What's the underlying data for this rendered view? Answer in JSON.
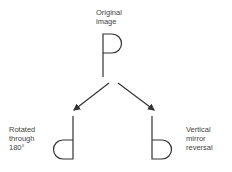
{
  "labels": {
    "original_line1": "Original",
    "original_line2": "image",
    "rotated_line1": "Rotated",
    "rotated_line2": "through",
    "rotated_line3": "180°",
    "mirror_line1": "Vertical",
    "mirror_line2": "mirror",
    "mirror_line3": "reversal"
  },
  "colors": {
    "stroke": "#333333",
    "background": "#ffffff"
  }
}
